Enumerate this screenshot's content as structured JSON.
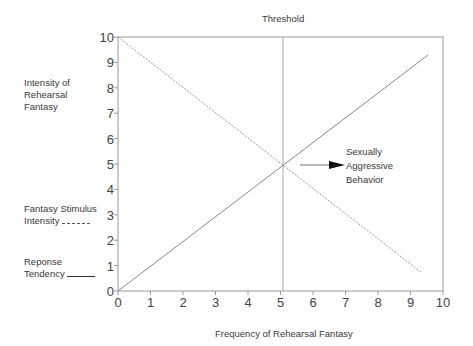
{
  "chart_data": {
    "type": "line",
    "title": "Threshold",
    "xlabel": "Frequency of Rehearsal Fantasy",
    "ylabel": "Intensity of Rehearsal Fantasy",
    "xlim": [
      0,
      10
    ],
    "ylim": [
      0,
      10
    ],
    "x_ticks": [
      "0",
      "1",
      "2",
      "3",
      "4",
      "5",
      "6",
      "7",
      "8",
      "9",
      "10"
    ],
    "y_ticks": [
      "0",
      "1",
      "2",
      "3",
      "4",
      "5",
      "6",
      "7",
      "8",
      "9",
      "10"
    ],
    "grid": false,
    "series": [
      {
        "name": "Fantasy Stimulus Intensity",
        "style": "dashed",
        "x": [
          0,
          9.3
        ],
        "y": [
          10,
          0.7
        ]
      },
      {
        "name": "Reponse Tendency",
        "style": "solid",
        "x": [
          0,
          9.4
        ],
        "y": [
          0,
          9.3
        ]
      }
    ],
    "threshold": {
      "label": "Threshold",
      "x": 5.1
    },
    "annotations": [
      {
        "text": "Sexually Aggressive Behavior",
        "arrow_from": [
          5.1,
          4.9
        ]
      }
    ],
    "legend_position": "left"
  },
  "labels": {
    "title": "Threshold",
    "xlabel": "Frequency of Rehearsal Fantasy",
    "ylabel_1": "Intensity of",
    "ylabel_2": "Rehearsal",
    "ylabel_3": "Fantasy",
    "legend_dashed_1": "Fantasy Stimulus",
    "legend_dashed_2": "Intensity",
    "legend_solid_1": "Reponse",
    "legend_solid_2": "Tendency",
    "annot_1": "Sexually",
    "annot_2": "Aggressive",
    "annot_3": "Behavior"
  }
}
